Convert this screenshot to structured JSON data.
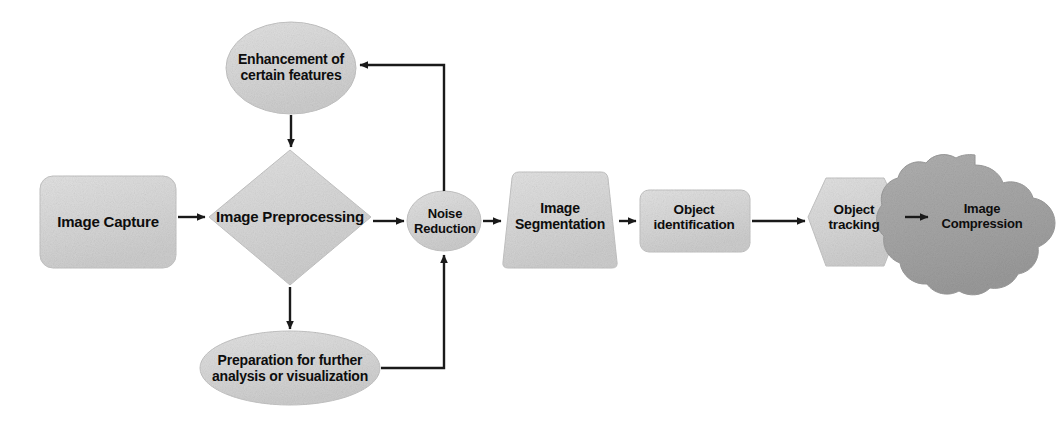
{
  "diagram": {
    "type": "flowchart",
    "background_color": "#ffffff",
    "palette": {
      "node_fill_light": "#d9d9d9",
      "node_fill_dark": "#a6a6a6",
      "node_stroke": "#bfbfbf",
      "connector_color": "#1a1a1a",
      "text_color": "#0d0d0d"
    },
    "nodes": [
      {
        "id": "image-capture",
        "label": "Image Capture",
        "shape": "rounded-rectangle",
        "fill": "#d9d9d9"
      },
      {
        "id": "image-preprocessing",
        "label": "Image Preprocessing",
        "shape": "diamond",
        "fill": "#d9d9d9"
      },
      {
        "id": "enhancement-of-certain-features",
        "label": "Enhancement of\ncertain features",
        "shape": "ellipse",
        "fill": "#d9d9d9"
      },
      {
        "id": "preparation-for-further-analysis",
        "label": "Preparation for further\nanalysis or visualization",
        "shape": "ellipse",
        "fill": "#d9d9d9"
      },
      {
        "id": "noise-reduction",
        "label": "Noise\nReduction",
        "shape": "ellipse",
        "fill": "#d9d9d9"
      },
      {
        "id": "image-segmentation",
        "label": "Image\nSegmentation",
        "shape": "trapezoid",
        "fill": "#d9d9d9"
      },
      {
        "id": "object-identification",
        "label": "Object\nidentification",
        "shape": "rounded-rectangle",
        "fill": "#d9d9d9"
      },
      {
        "id": "object-tracking",
        "label": "Object\ntracking",
        "shape": "hexagon",
        "fill": "#d9d9d9"
      },
      {
        "id": "image-compression",
        "label": "Image\nCompression",
        "shape": "cloud",
        "fill": "#a6a6a6"
      }
    ],
    "edges": [
      {
        "id": "capture-to-preprocessing",
        "from": "image-capture",
        "to": "image-preprocessing",
        "style": "straight-arrow",
        "direction": "right"
      },
      {
        "id": "enhancement-to-preprocessing",
        "from": "enhancement-of-certain-features",
        "to": "image-preprocessing",
        "style": "straight-arrow",
        "direction": "down"
      },
      {
        "id": "preprocessing-to-preparation",
        "from": "image-preprocessing",
        "to": "preparation-for-further-analysis",
        "style": "straight-arrow",
        "direction": "down"
      },
      {
        "id": "preprocessing-to-noise-reduction",
        "from": "image-preprocessing",
        "to": "noise-reduction",
        "style": "straight-arrow",
        "direction": "right"
      },
      {
        "id": "noise-reduction-to-enhancement",
        "from": "noise-reduction",
        "to": "enhancement-of-certain-features",
        "style": "elbow-arrow",
        "direction": "up-then-left"
      },
      {
        "id": "preparation-to-noise-reduction",
        "from": "preparation-for-further-analysis",
        "to": "noise-reduction",
        "style": "elbow-arrow",
        "direction": "right-then-up"
      },
      {
        "id": "noise-reduction-to-segmentation",
        "from": "noise-reduction",
        "to": "image-segmentation",
        "style": "straight-arrow",
        "direction": "right"
      },
      {
        "id": "segmentation-to-object-identification",
        "from": "image-segmentation",
        "to": "object-identification",
        "style": "straight-arrow",
        "direction": "right"
      },
      {
        "id": "object-identification-to-object-tracking",
        "from": "object-identification",
        "to": "object-tracking",
        "style": "straight-arrow",
        "direction": "right"
      },
      {
        "id": "object-tracking-to-image-compression",
        "from": "object-tracking",
        "to": "image-compression",
        "style": "straight-arrow",
        "direction": "right"
      }
    ]
  }
}
